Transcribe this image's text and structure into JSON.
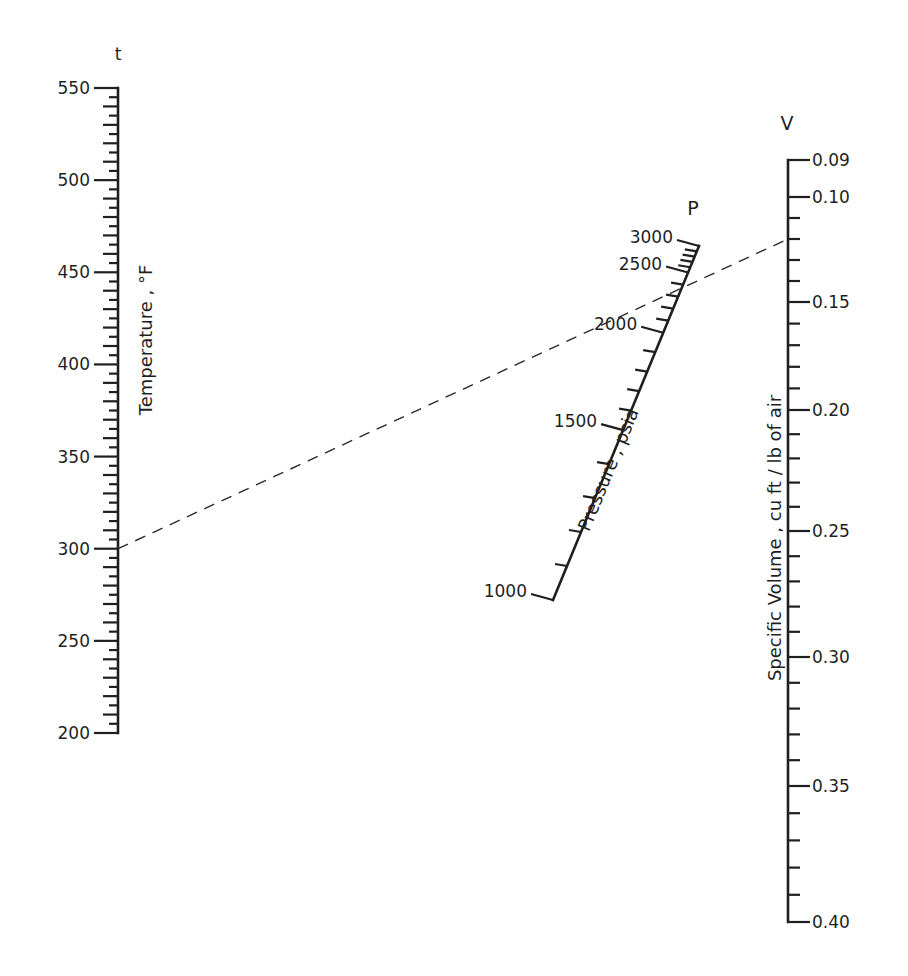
{
  "chart_data": {
    "type": "nomogram",
    "title": "",
    "scales": [
      {
        "id": "t",
        "symbol": "t",
        "label": "Temperature , °F",
        "min": 200,
        "max": 550,
        "major_ticks": [
          200,
          250,
          300,
          350,
          400,
          450,
          500,
          550
        ],
        "minor_step": 5,
        "orientation": "vertical",
        "position": "left"
      },
      {
        "id": "P",
        "symbol": "P",
        "label": "Pressure , psia",
        "min": 1000,
        "max": 3000,
        "major_ticks": [
          1000,
          1500,
          2000,
          2500,
          3000
        ],
        "minor_step": 100,
        "orientation": "slanted",
        "position": "center-right"
      },
      {
        "id": "V",
        "symbol": "V",
        "label": "Specific Volume , cu ft / lb of air",
        "min": 0.09,
        "max": 0.4,
        "major_ticks": [
          0.09,
          0.1,
          0.15,
          0.2,
          0.25,
          0.3,
          0.35,
          0.4
        ],
        "major_labels": [
          "0.09",
          "0.10",
          "0.15",
          "0.20",
          "0.25",
          "0.30",
          "0.35",
          "0.40"
        ],
        "minor_step": 0.01,
        "orientation": "vertical",
        "position": "right"
      }
    ],
    "example_isopleth": {
      "t": 300,
      "P": 2500,
      "V": 0.12,
      "style": "dashed"
    }
  }
}
